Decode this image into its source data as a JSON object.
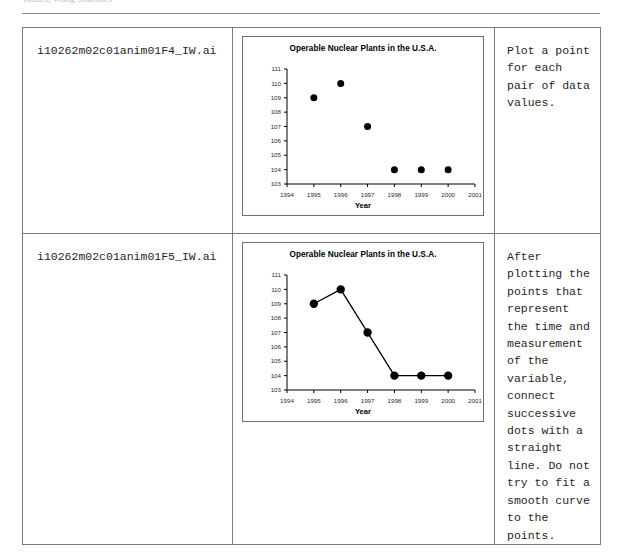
{
  "document": {
    "running_header": "Vander, Wong    Statistics",
    "table": {
      "columns": [
        "filename",
        "figure",
        "note"
      ],
      "rows": [
        {
          "filename": "i10262m02c01anim01F4_IW.ai",
          "note": "Plot a point for each pair of data values.",
          "figure_id": "chart_scatter"
        },
        {
          "filename": "i10262m02c01anim01F5_IW.ai",
          "note": "After plotting the points that represent the time and measurement of the variable, connect successive dots with a straight line. Do not try to fit a smooth curve to the points.",
          "figure_id": "chart_line"
        }
      ]
    }
  },
  "chart_data": [
    {
      "id": "chart_scatter",
      "type": "scatter",
      "title": "Operable Nuclear Plants in the U.S.A.",
      "xlabel": "Year",
      "ylabel": "",
      "x": [
        1995,
        1996,
        1997,
        1998,
        1999,
        2000
      ],
      "values": [
        109,
        110,
        107,
        104,
        104,
        104
      ],
      "xlim": [
        1994,
        2001
      ],
      "ylim": [
        103,
        111
      ],
      "xticks": [
        "1994",
        "1995",
        "1996",
        "1997",
        "1998",
        "1999",
        "2000",
        "2001"
      ],
      "yticks": [
        "103",
        "104",
        "105",
        "106",
        "107",
        "108",
        "109",
        "110",
        "111"
      ],
      "grid": false,
      "legend": "none",
      "marker_color": "#000000",
      "connect_points": false
    },
    {
      "id": "chart_line",
      "type": "line",
      "title": "Operable Nuclear Plants in the U.S.A.",
      "xlabel": "Year",
      "ylabel": "",
      "x": [
        1995,
        1996,
        1997,
        1998,
        1999,
        2000
      ],
      "values": [
        109,
        110,
        107,
        104,
        104,
        104
      ],
      "xlim": [
        1994,
        2001
      ],
      "ylim": [
        103,
        111
      ],
      "xticks": [
        "1994",
        "1995",
        "1996",
        "1997",
        "1998",
        "1999",
        "2000",
        "2001"
      ],
      "yticks": [
        "103",
        "104",
        "105",
        "106",
        "107",
        "108",
        "109",
        "110",
        "111"
      ],
      "grid": false,
      "legend": "none",
      "marker_color": "#000000",
      "line_color": "#000000",
      "connect_points": true
    }
  ]
}
